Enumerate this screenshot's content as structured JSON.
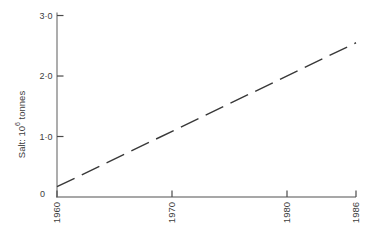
{
  "figure": {
    "background": "#ffffff",
    "axis_color": "#8a8a8a",
    "tick_color": "#4a4a4a",
    "text_color": "#3d3d3d"
  },
  "chart_data": {
    "type": "line",
    "title": "",
    "xlabel": "",
    "ylabel": "Salt: 10⁶ tonnes",
    "ylabel_parts": {
      "prefix": "Salt: 10",
      "superscript": "6",
      "suffix": " tonnes"
    },
    "xlim": [
      1960,
      1986
    ],
    "ylim": [
      0,
      3.05
    ],
    "grid": false,
    "legend": null,
    "x_ticks": [
      {
        "label": "1960",
        "value": 1960
      },
      {
        "label": "1970",
        "value": 1970
      },
      {
        "label": "1980",
        "value": 1980
      },
      {
        "label": "1986",
        "value": 1986
      }
    ],
    "y_ticks": [
      {
        "label": "3·0",
        "value": 3.0
      },
      {
        "label": "2·0",
        "value": 2.0
      },
      {
        "label": "1·0",
        "value": 1.0
      },
      {
        "label": "0",
        "value": 0
      }
    ],
    "series": [
      {
        "name": "salt-production-trend",
        "line_style": "dashed",
        "color": "#383838",
        "x": [
          1960,
          1986
        ],
        "y": [
          0.17,
          2.55
        ]
      }
    ]
  }
}
